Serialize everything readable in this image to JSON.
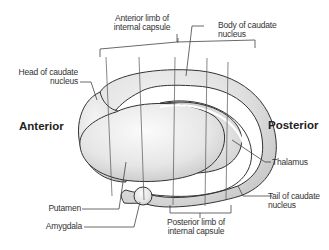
{
  "diagram": {
    "orientation": {
      "anterior": "Anterior",
      "posterior": "Posterior"
    },
    "labels": {
      "anterior_limb_line1": "Anterior limb of",
      "anterior_limb_line2": "internal capsule",
      "body_caudate_line1": "Body of caudate",
      "body_caudate_line2": "nucleus",
      "head_caudate_line1": "Head of caudate",
      "head_caudate_line2": "nucleus",
      "thalamus": "Thalamus",
      "tail_caudate_line1": "Tail of caudate",
      "tail_caudate_line2": "nucleus",
      "putamen": "Putamen",
      "amygdala": "Amygdala",
      "posterior_limb_line1": "Posterior limb of",
      "posterior_limb_line2": "internal capsule"
    },
    "colors": {
      "outline": "#333333",
      "fill_light": "#f4f4f4",
      "fill_mid": "#d6d6d6",
      "fill_dark": "#bdbdbd",
      "leader_line": "#444444"
    }
  }
}
